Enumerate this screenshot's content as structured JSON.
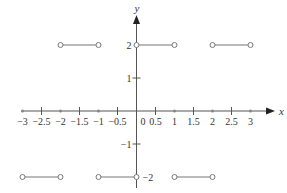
{
  "chart_data": {
    "type": "line",
    "title": "",
    "xlabel": "x",
    "ylabel": "y",
    "xlim": [
      -3,
      3
    ],
    "ylim": [
      -2,
      2
    ],
    "x_ticks": [
      "-3",
      "-2.5",
      "-2",
      "-1.5",
      "-1",
      "-0.5",
      "0",
      "0.5",
      "1",
      "1.5",
      "2",
      "2.5",
      "3"
    ],
    "y_ticks": [
      "2",
      "1",
      "-1",
      "-2"
    ],
    "grid": false,
    "segments": [
      {
        "x": [
          -3,
          -2
        ],
        "y": [
          -2,
          -2
        ],
        "endpoints": "open"
      },
      {
        "x": [
          -2,
          -1
        ],
        "y": [
          2,
          2
        ],
        "endpoints": "open"
      },
      {
        "x": [
          -1,
          0
        ],
        "y": [
          -2,
          -2
        ],
        "endpoints": "open"
      },
      {
        "x": [
          0,
          1
        ],
        "y": [
          2,
          2
        ],
        "endpoints": "open"
      },
      {
        "x": [
          1,
          2
        ],
        "y": [
          -2,
          -2
        ],
        "endpoints": "open"
      },
      {
        "x": [
          2,
          3
        ],
        "y": [
          2,
          2
        ],
        "endpoints": "open"
      }
    ],
    "colors": {
      "line": "#777777",
      "axis": "#555555",
      "text": "#333333"
    }
  }
}
